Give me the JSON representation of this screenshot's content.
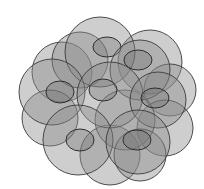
{
  "diagram": {
    "colors": {
      "background": "#ffffff",
      "circle_fill": "#8a8a8a",
      "circle_stroke": "#3a3a3a",
      "inner_fill": "#6e6e6e",
      "inner_stroke": "#2e2e2e"
    },
    "background_circles": [
      {
        "cx": 62,
        "cy": 72,
        "r": 30
      },
      {
        "cx": 150,
        "cy": 62,
        "r": 32
      },
      {
        "cx": 170,
        "cy": 90,
        "r": 26
      },
      {
        "cx": 50,
        "cy": 118,
        "r": 28
      },
      {
        "cx": 165,
        "cy": 128,
        "r": 28
      },
      {
        "cx": 110,
        "cy": 155,
        "r": 30
      },
      {
        "cx": 80,
        "cy": 60,
        "r": 28
      },
      {
        "cx": 125,
        "cy": 120,
        "r": 30
      },
      {
        "cx": 140,
        "cy": 155,
        "r": 26
      }
    ],
    "main_circles": [
      {
        "cx": 100,
        "cy": 52,
        "r": 35,
        "inner": {
          "cx": 107,
          "cy": 47,
          "rx": 14,
          "ry": 10
        }
      },
      {
        "cx": 140,
        "cy": 70,
        "r": 30,
        "inner": {
          "cx": 138,
          "cy": 60,
          "rx": 14,
          "ry": 10
        }
      },
      {
        "cx": 52,
        "cy": 92,
        "r": 33,
        "inner": {
          "cx": 60,
          "cy": 92,
          "rx": 14,
          "ry": 11
        }
      },
      {
        "cx": 110,
        "cy": 95,
        "r": 33,
        "inner": {
          "cx": 103,
          "cy": 90,
          "rx": 14,
          "ry": 11
        }
      },
      {
        "cx": 158,
        "cy": 100,
        "r": 28,
        "inner": {
          "cx": 155,
          "cy": 98,
          "rx": 14,
          "ry": 10
        }
      },
      {
        "cx": 78,
        "cy": 140,
        "r": 35,
        "inner": {
          "cx": 80,
          "cy": 140,
          "rx": 14,
          "ry": 11
        }
      },
      {
        "cx": 138,
        "cy": 142,
        "r": 32,
        "inner": {
          "cx": 137,
          "cy": 140,
          "rx": 14,
          "ry": 10
        }
      }
    ]
  }
}
